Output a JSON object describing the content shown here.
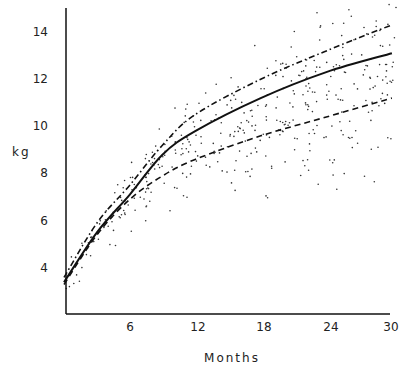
{
  "chart_data": {
    "type": "line",
    "title": "",
    "xlabel": "Months",
    "ylabel": "kg",
    "xlim": [
      0,
      30
    ],
    "ylim": [
      2,
      15
    ],
    "xticks": [
      6,
      12,
      18,
      24,
      30
    ],
    "yticks": [
      4,
      6,
      8,
      10,
      12,
      14
    ],
    "grid": false,
    "legend": null,
    "x": [
      0,
      3,
      6,
      9,
      12,
      18,
      24,
      30
    ],
    "series": [
      {
        "name": "solid",
        "style": "solid",
        "values": [
          3.4,
          5.5,
          7.1,
          8.8,
          9.8,
          11.2,
          12.3,
          13.1
        ]
      },
      {
        "name": "dash-dot",
        "style": "dashdot",
        "values": [
          3.6,
          5.9,
          7.5,
          9.2,
          10.5,
          12.0,
          13.2,
          14.3
        ]
      },
      {
        "name": "dashed",
        "style": "dashed",
        "values": [
          3.3,
          5.4,
          6.9,
          7.9,
          8.6,
          9.6,
          10.4,
          11.2
        ]
      }
    ],
    "scatter": {
      "description": "Individual weight observations (dots) scattered around the curves",
      "approx_count": 400
    }
  },
  "labels": {
    "y_axis": "kg",
    "x_axis": "Months",
    "y_ticks": [
      "4",
      "6",
      "8",
      "10",
      "12",
      "14"
    ],
    "x_ticks": [
      "6",
      "12",
      "18",
      "24",
      "30"
    ]
  }
}
